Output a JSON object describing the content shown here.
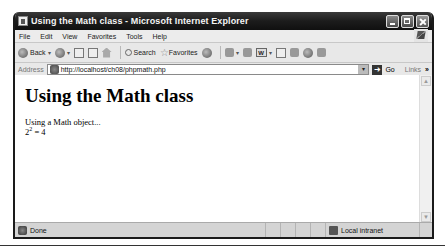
{
  "window": {
    "title": "Using the Math class - Microsoft Internet Explorer",
    "controls": [
      "minimize",
      "maximize",
      "close"
    ]
  },
  "menubar": {
    "items": [
      "File",
      "Edit",
      "View",
      "Favorites",
      "Tools",
      "Help"
    ]
  },
  "toolbar": {
    "back_label": "Back",
    "search_label": "Search",
    "favorites_label": "Favorites",
    "word_icon_text": "W"
  },
  "addressbar": {
    "label": "Address",
    "url": "http://localhost/ch08/phpmath.php",
    "go_label": "Go",
    "links_label": "Links",
    "chevron": "»"
  },
  "page": {
    "heading": "Using the Math class",
    "line1": "Using a Math object...",
    "expr_base": "2",
    "expr_exp": "2",
    "expr_rest": " = 4"
  },
  "statusbar": {
    "status": "Done",
    "zone": "Local intranet"
  }
}
